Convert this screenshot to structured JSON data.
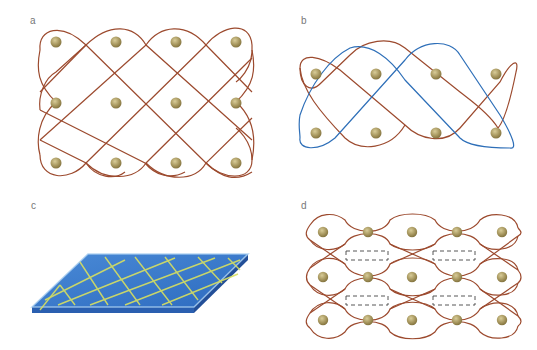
{
  "figure": {
    "panels": [
      {
        "id": "a",
        "label": "a",
        "description": "3x4 array of spheres enclosed by interlaced brown loops forming a diamond lattice"
      },
      {
        "id": "b",
        "label": "b",
        "description": "2x4 array of spheres enclosed by two interlaced loops, one blue and one brown"
      },
      {
        "id": "c",
        "label": "c",
        "description": "Blue slab with yellow diagonal lattice lines in perspective"
      },
      {
        "id": "d",
        "label": "d",
        "description": "3x5 array of spheres within brown woven loops with four dashed rectangles marking gaps"
      }
    ],
    "colors": {
      "loop_brown": "#9c4a2e",
      "loop_blue": "#2e6fb8",
      "sphere": "#b3a46e",
      "slab_top": "#3a7ccc",
      "slab_side": "#2a5fb0",
      "lattice_yellow": "#d8e060",
      "label": "#777777",
      "dashed_box": "#444444"
    }
  }
}
